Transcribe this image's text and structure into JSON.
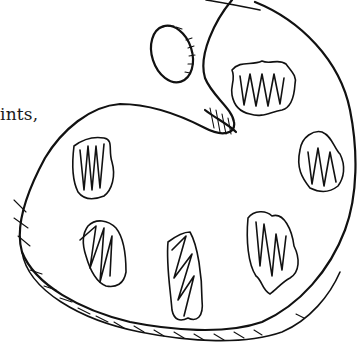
{
  "illustration": {
    "subject": "artist paint palette line drawing",
    "text_fragment": "ints,",
    "colors": {
      "ink": "#111111",
      "background": "#ffffff"
    },
    "paint_blobs": [
      {
        "id": "blob-top-right",
        "cx": 278,
        "cy": 98
      },
      {
        "id": "blob-right",
        "cx": 318,
        "cy": 160
      },
      {
        "id": "blob-left",
        "cx": 97,
        "cy": 170
      },
      {
        "id": "blob-bottom-left",
        "cx": 104,
        "cy": 250
      },
      {
        "id": "blob-bottom-center",
        "cx": 185,
        "cy": 290
      },
      {
        "id": "blob-bottom-right",
        "cx": 276,
        "cy": 250
      }
    ]
  }
}
